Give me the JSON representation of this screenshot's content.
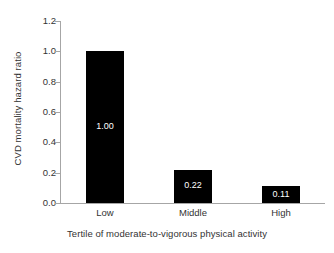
{
  "chart_data": {
    "type": "bar",
    "title": "",
    "categories": [
      "Low",
      "Middle",
      "High"
    ],
    "values": [
      1.0,
      0.22,
      0.11
    ],
    "data_labels": [
      "1.00",
      "0.22",
      "0.11"
    ],
    "xlabel": "Tertile of moderate-to-vigorous physical activity",
    "ylabel": "CVD mortality hazard ratio",
    "ylim": [
      0.0,
      1.2
    ],
    "ytick_labels": [
      "0.0",
      "0.2",
      "0.4",
      "0.6",
      "0.8",
      "1.0",
      "1.2"
    ],
    "ytick_values": [
      0.0,
      0.2,
      0.4,
      0.6,
      0.8,
      1.0,
      1.2
    ],
    "grid": false,
    "legend": false,
    "bar_color": "#000000",
    "data_label_color": "#ffffff",
    "axis_color": "#a6a6a6",
    "text_color": "#333333",
    "background_color": "#ffffff"
  }
}
